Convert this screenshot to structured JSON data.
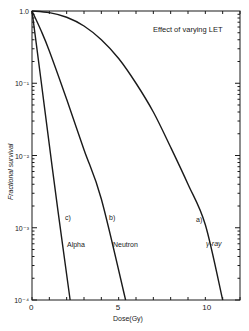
{
  "chart_data": {
    "type": "line",
    "title": "Effect of varying LET",
    "xlabel": "Dose(Gy)",
    "ylabel": "Fractional survival",
    "xlim": [
      0,
      12
    ],
    "ylim": [
      0.0001,
      1.0
    ],
    "yscale": "log",
    "grid": false,
    "x_ticks": [
      0,
      5,
      10
    ],
    "x_tick_labels": [
      "0",
      "5",
      "10"
    ],
    "y_ticks": [
      1.0,
      0.1,
      0.01,
      0.001,
      0.0001
    ],
    "y_tick_labels": [
      "1.0",
      "10⁻¹",
      "10⁻²",
      "10⁻³",
      "10⁻⁴"
    ],
    "series": [
      {
        "name": "Alpha",
        "label": "c)",
        "x": [
          0,
          0.5,
          1.0,
          1.5,
          2.2
        ],
        "y": [
          1.0,
          0.12,
          0.014,
          0.0017,
          0.0001
        ]
      },
      {
        "name": "Neutron",
        "label": "b)",
        "x": [
          0,
          0.5,
          1.0,
          2.0,
          3.0,
          4.0,
          5.4
        ],
        "y": [
          1.0,
          0.55,
          0.28,
          0.06,
          0.012,
          0.0025,
          0.0001
        ]
      },
      {
        "name": "γ-ray",
        "label": "a)",
        "x": [
          0,
          1,
          2,
          3,
          4,
          5,
          6,
          7,
          8,
          9,
          10,
          11
        ],
        "y": [
          1.0,
          0.95,
          0.82,
          0.62,
          0.4,
          0.22,
          0.1,
          0.04,
          0.013,
          0.004,
          0.0011,
          0.0001
        ]
      }
    ],
    "annotations": [
      {
        "text": "c)",
        "series": "Alpha"
      },
      {
        "text": "Alpha",
        "series": "Alpha"
      },
      {
        "text": "b)",
        "series": "Neutron"
      },
      {
        "text": "Neutron",
        "series": "Neutron"
      },
      {
        "text": "a)",
        "series": "γ-ray"
      },
      {
        "text": "γ-ray",
        "series": "γ-ray"
      }
    ]
  }
}
